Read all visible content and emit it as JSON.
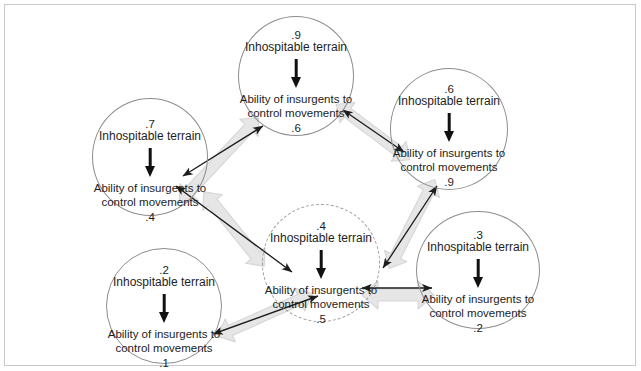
{
  "figure": {
    "cause_label": "Inhospitable terrain",
    "effect_label_line1": "Ability of insurgents to",
    "effect_label_line2": "control movements",
    "colors": {
      "node_stroke": "#8d8d8d",
      "dashed_stroke": "#9b9b9b",
      "black_arrow": "#1d1d1d",
      "gray_arrow": "#e3e3e3",
      "gray_arrow_stroke": "#d2d2d2",
      "frame": "#c9c9c9",
      "text": "#1d1d1d"
    }
  },
  "nodes": [
    {
      "id": "top",
      "cause_value": ".9",
      "cause_label": "Inhospitable terrain",
      "effect_line1": "Ability of insurgents to",
      "effect_line2": "control movements",
      "effect_value": ".6",
      "style": "solid"
    },
    {
      "id": "upper-right",
      "cause_value": ".6",
      "cause_label": "Inhospitable terrain",
      "effect_line1": "Ability of insurgents to",
      "effect_line2": "control movements",
      "effect_value": ".9",
      "style": "solid"
    },
    {
      "id": "left",
      "cause_value": ".7",
      "cause_label": "Inhospitable terrain",
      "effect_line1": "Ability of insurgents to",
      "effect_line2": "control movements",
      "effect_value": ".4",
      "style": "solid"
    },
    {
      "id": "center",
      "cause_value": ".4",
      "cause_label": "Inhospitable terrain",
      "effect_line1": "Ability of insurgents to",
      "effect_line2": "control movements",
      "effect_value": ".5",
      "style": "dashed"
    },
    {
      "id": "right",
      "cause_value": ".3",
      "cause_label": "Inhospitable terrain",
      "effect_line1": "Ability of insurgents to",
      "effect_line2": "control movements",
      "effect_value": ".2",
      "style": "solid"
    },
    {
      "id": "bottom-left",
      "cause_value": ".2",
      "cause_label": "Inhospitable terrain",
      "effect_line1": "Ability of insurgents to",
      "effect_line2": "control movements",
      "effect_value": ".1",
      "style": "solid"
    }
  ],
  "links": [
    {
      "from": "left",
      "to": "top",
      "type": "bidirectional"
    },
    {
      "from": "top",
      "to": "upper-right",
      "type": "bidirectional"
    },
    {
      "from": "upper-right",
      "to": "center",
      "type": "bidirectional"
    },
    {
      "from": "center",
      "to": "right",
      "type": "bidirectional"
    },
    {
      "from": "bottom-left",
      "to": "center",
      "type": "bidirectional"
    },
    {
      "from": "left",
      "to": "center",
      "type": "bidirectional"
    }
  ]
}
